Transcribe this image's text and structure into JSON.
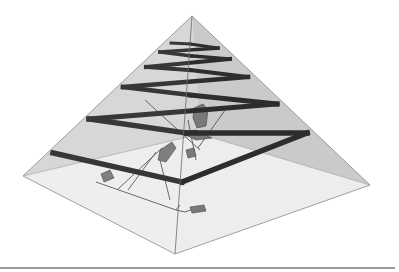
{
  "figure": {
    "colors": {
      "background": "#ffffff",
      "upper_faces": "#c9c9c9",
      "left_face": "#d4d4d4",
      "floor": "#ececec",
      "edge": "#8a8a8a",
      "ramp": "#1c1c1c",
      "chamber": "#6e6e6e",
      "rule": "#3a3a3a"
    },
    "vertices": {
      "apex": [
        192,
        16
      ],
      "left": [
        23,
        176
      ],
      "right": [
        370,
        185
      ],
      "front": [
        175,
        254
      ],
      "back": [
        200,
        134
      ]
    },
    "ramps": [
      {
        "from": [
          53,
          153
        ],
        "to": [
          182,
          182
        ]
      },
      {
        "from": [
          182,
          182
        ],
        "to": [
          307,
          133
        ]
      },
      {
        "from": [
          307,
          133
        ],
        "to": [
          186,
          132
        ]
      },
      {
        "from": [
          89,
          119
        ],
        "to": [
          186,
          132
        ]
      },
      {
        "from": [
          89,
          119
        ],
        "to": [
          277,
          104
        ]
      },
      {
        "from": [
          277,
          104
        ],
        "to": [
          190,
          95
        ]
      },
      {
        "from": [
          123,
          87
        ],
        "to": [
          190,
          95
        ]
      },
      {
        "from": [
          123,
          87
        ],
        "to": [
          248,
          77
        ]
      },
      {
        "from": [
          248,
          77
        ],
        "to": [
          190,
          70
        ]
      },
      {
        "from": [
          146,
          67
        ],
        "to": [
          190,
          70
        ]
      },
      {
        "from": [
          146,
          67
        ],
        "to": [
          230,
          59
        ]
      },
      {
        "from": [
          230,
          59
        ],
        "to": [
          192,
          55
        ]
      },
      {
        "from": [
          160,
          52
        ],
        "to": [
          192,
          55
        ]
      },
      {
        "from": [
          160,
          52
        ],
        "to": [
          218,
          48
        ]
      },
      {
        "from": [
          218,
          48
        ],
        "to": [
          190,
          44
        ]
      },
      {
        "from": [
          171,
          43
        ],
        "to": [
          190,
          44
        ]
      }
    ],
    "footer_rule": {
      "y": 268,
      "x1": 0,
      "x2": 395
    }
  }
}
